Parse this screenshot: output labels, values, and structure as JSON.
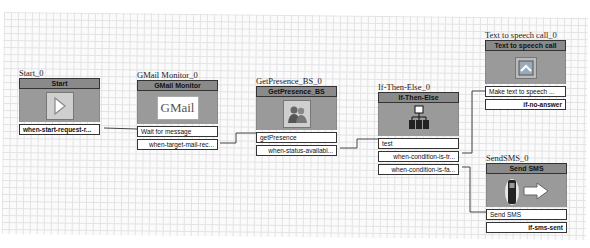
{
  "canvas": {
    "background": "#fbfbfb",
    "grid_color": "#e3e3e6"
  },
  "blocks": [
    {
      "id": "start",
      "instance_label": "Start_0",
      "title": "Start",
      "icon": "play-arrow-icon",
      "inputs": [],
      "outputs": [
        "when-start-request-r..."
      ]
    },
    {
      "id": "gmail",
      "instance_label": "GMail Monitor_0",
      "title": "GMail Monitor",
      "icon": "gmail-logo-icon",
      "icon_text": "GMail",
      "inputs": [
        "Wait for message"
      ],
      "outputs": [
        "when-target-mail-rec..."
      ]
    },
    {
      "id": "presence",
      "instance_label": "GetPresence_BS_0",
      "title": "GetPresence_BS",
      "icon": "people-icon",
      "inputs": [
        "getPresence"
      ],
      "outputs": [
        "when-status-availabl..."
      ]
    },
    {
      "id": "ifelse",
      "instance_label": "If-Then-Else_0",
      "title": "If-Then-Else",
      "icon": "org-chart-icon",
      "inputs": [
        "test"
      ],
      "outputs": [
        "when-condition-is-tr...",
        "when-condition-is-fa..."
      ]
    },
    {
      "id": "tts",
      "instance_label": "Text to speech call_0",
      "title": "Text to speech call",
      "icon": "phone-call-icon",
      "inputs": [
        "Make text to speech ..."
      ],
      "outputs": [
        "if-no-answer"
      ]
    },
    {
      "id": "sms",
      "instance_label": "SendSMS_0",
      "title": "Send SMS",
      "icon": "mobile-phone-arrow-icon",
      "inputs": [
        "Send SMS"
      ],
      "outputs": [
        "if-sms-sent"
      ]
    }
  ],
  "connections": [
    {
      "from": "Start_0.when-start-request-r...",
      "to": "GMail Monitor_0.Wait for message"
    },
    {
      "from": "GMail Monitor_0.when-target-mail-rec...",
      "to": "GetPresence_BS_0.getPresence"
    },
    {
      "from": "GetPresence_BS_0.when-status-availabl...",
      "to": "If-Then-Else_0.test"
    },
    {
      "from": "If-Then-Else_0.when-condition-is-tr...",
      "to": "Text to speech call_0.Make text to speech ..."
    },
    {
      "from": "If-Then-Else_0.when-condition-is-fa...",
      "to": "SendSMS_0.Send SMS"
    }
  ]
}
